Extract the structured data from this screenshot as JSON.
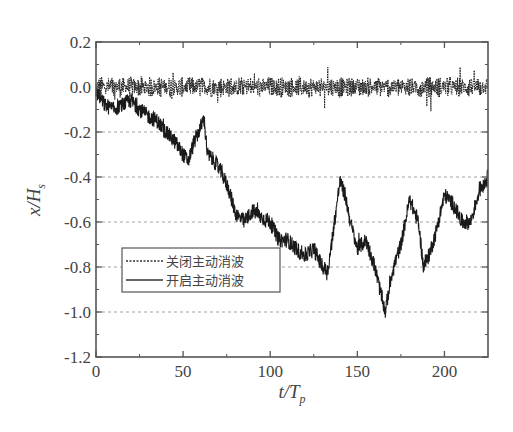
{
  "chart_data": {
    "type": "line",
    "title": "",
    "xlabel": "t/T_p",
    "xlabel_main": "t/T",
    "xlabel_sub": "p",
    "ylabel": "x/H_s",
    "ylabel_main": "x/H",
    "ylabel_sub": "s",
    "xlim": [
      0,
      225
    ],
    "ylim": [
      -1.2,
      0.2
    ],
    "x_ticks": [
      0,
      50,
      100,
      150,
      200
    ],
    "x_tick_labels": [
      "0",
      "50",
      "100",
      "150",
      "200"
    ],
    "y_ticks": [
      0.2,
      0.0,
      -0.2,
      -0.4,
      -0.6,
      -0.8,
      -1.0,
      -1.2
    ],
    "y_tick_labels": [
      "0.2",
      "0.0",
      "-0.2",
      "-0.4",
      "-0.6",
      "-0.8",
      "-1.0",
      "-1.2"
    ],
    "grid": {
      "horizontal": true,
      "style": "dashed",
      "levels": [
        -0.2,
        -0.4,
        -0.6,
        -0.8,
        -1.0
      ]
    },
    "legend": {
      "position": "lower-left",
      "entries": [
        {
          "label": "关闭主动消波",
          "style": "dotted"
        },
        {
          "label": "开启主动消波",
          "style": "solid"
        }
      ]
    },
    "series": [
      {
        "name": "关闭主动消波",
        "style": "dotted",
        "description": "oscillates around 0.0 with amplitude about ±0.06 over the full range",
        "x": [
          0,
          25,
          50,
          75,
          100,
          125,
          150,
          175,
          200,
          225
        ],
        "y": [
          0.0,
          0.0,
          0.0,
          0.0,
          0.0,
          0.0,
          0.0,
          0.0,
          0.0,
          0.0
        ],
        "amplitude": 0.06
      },
      {
        "name": "开启主动消波",
        "style": "solid",
        "x": [
          0,
          5,
          10,
          15,
          20,
          25,
          30,
          35,
          40,
          45,
          50,
          53,
          56,
          60,
          62,
          64,
          68,
          72,
          76,
          80,
          85,
          90,
          95,
          100,
          105,
          110,
          115,
          120,
          125,
          130,
          133,
          136,
          140,
          143,
          146,
          150,
          155,
          160,
          163,
          166,
          170,
          175,
          180,
          185,
          188,
          191,
          195,
          200,
          205,
          210,
          215,
          220,
          225
        ],
        "y": [
          -0.02,
          -0.08,
          -0.1,
          -0.08,
          -0.06,
          -0.1,
          -0.13,
          -0.15,
          -0.2,
          -0.24,
          -0.3,
          -0.33,
          -0.25,
          -0.18,
          -0.14,
          -0.3,
          -0.33,
          -0.38,
          -0.45,
          -0.56,
          -0.6,
          -0.55,
          -0.58,
          -0.6,
          -0.68,
          -0.68,
          -0.72,
          -0.75,
          -0.72,
          -0.8,
          -0.82,
          -0.65,
          -0.42,
          -0.48,
          -0.6,
          -0.72,
          -0.68,
          -0.8,
          -0.9,
          -1.0,
          -0.82,
          -0.7,
          -0.5,
          -0.6,
          -0.8,
          -0.75,
          -0.65,
          -0.48,
          -0.52,
          -0.6,
          -0.6,
          -0.46,
          -0.4
        ]
      }
    ]
  }
}
